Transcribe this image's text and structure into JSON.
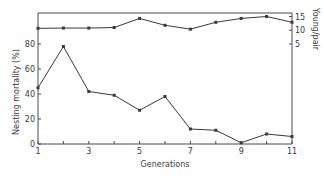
{
  "chart_data": {
    "type": "line",
    "title": "",
    "xlabel": "Generations",
    "ylabel": "Nesting mortality (%)",
    "y2label": "Young/pair",
    "x": [
      1,
      2,
      3,
      4,
      5,
      6,
      7,
      8,
      9,
      10,
      11
    ],
    "x_tick_labels": [
      "1",
      "3",
      "5",
      "7",
      "9",
      "11"
    ],
    "x_tick_values": [
      1,
      3,
      5,
      7,
      9,
      11
    ],
    "y_tick_values": [
      0,
      20,
      40,
      60,
      80
    ],
    "y2_tick_values": [
      5,
      10,
      15
    ],
    "ylim": [
      0,
      105
    ],
    "y2lim": [
      0,
      16
    ],
    "grid": false,
    "legend": null,
    "series": [
      {
        "name": "Nesting mortality (%)",
        "axis": "left",
        "values": [
          45,
          78,
          42,
          39,
          27,
          38,
          12,
          11,
          1,
          8,
          6
        ]
      },
      {
        "name": "Young/pair",
        "axis": "right",
        "values": [
          10.7,
          10.8,
          10.8,
          11.0,
          14.3,
          11.8,
          10.4,
          12.9,
          14.3,
          15.0,
          12.9
        ]
      }
    ]
  },
  "colors": {
    "line": "#3a3a3a",
    "axis": "#4a4a4a"
  }
}
